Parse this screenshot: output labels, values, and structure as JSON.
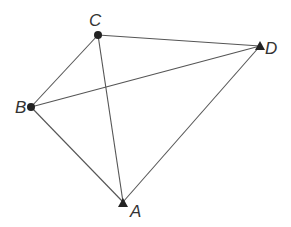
{
  "diagram": {
    "type": "quadrilateral-with-diagonals",
    "points": {
      "A": {
        "label": "A",
        "x": 123,
        "y": 202,
        "marker": "triangle"
      },
      "B": {
        "label": "B",
        "x": 31,
        "y": 107,
        "marker": "circle"
      },
      "C": {
        "label": "C",
        "x": 98,
        "y": 35,
        "marker": "circle"
      },
      "D": {
        "label": "D",
        "x": 260,
        "y": 46,
        "marker": "triangle"
      }
    },
    "edges": [
      [
        "B",
        "C"
      ],
      [
        "C",
        "D"
      ],
      [
        "D",
        "A"
      ],
      [
        "A",
        "B"
      ],
      [
        "B",
        "D"
      ],
      [
        "C",
        "A"
      ]
    ],
    "colors": {
      "line": "#555555",
      "marker": "#222222",
      "label": "#333333"
    }
  }
}
